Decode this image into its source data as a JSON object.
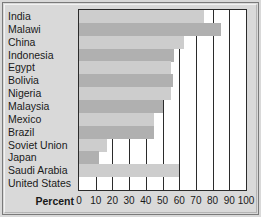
{
  "chart_data": {
    "type": "bar",
    "orientation": "horizontal",
    "title": "",
    "xlabel": "Percent",
    "ylabel": "",
    "xlim": [
      0,
      100
    ],
    "xticks": [
      0,
      10,
      20,
      30,
      40,
      50,
      60,
      70,
      80,
      90,
      100
    ],
    "grid": true,
    "legend": null,
    "categories": [
      "India",
      "Malawi",
      "China",
      "Indonesia",
      "Egypt",
      "Bolivia",
      "Nigeria",
      "Malaysia",
      "Mexico",
      "Brazil",
      "Soviet Union",
      "Japan",
      "Saudi Arabia",
      "United States"
    ],
    "values": [
      75,
      85,
      63,
      57,
      55,
      56,
      55,
      50,
      45,
      45,
      17,
      12,
      60,
      0
    ]
  },
  "colors": {
    "bar_shade_a": "#b0b0b0",
    "bar_shade_b": "#cdcdcd",
    "plot_background": "#ffffff",
    "panel_background": "#d9d9d9",
    "axis": "#2b2b2b",
    "text": "#1a1a1a"
  }
}
